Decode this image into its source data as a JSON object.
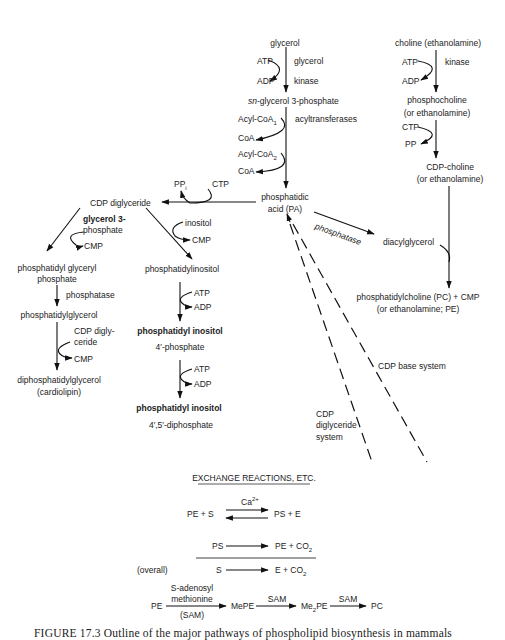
{
  "figure": {
    "caption": "FIGURE 17.3  Outline of the major pathways of phospholipid biosynthesis in mammals"
  },
  "glycerol_branch": {
    "start": "glycerol",
    "step1_in": "ATP",
    "step1_out": "ADP",
    "step1_enzyme_line1": "glycerol",
    "step1_enzyme_line2": "kinase",
    "intermediate_prefix": "sn",
    "intermediate": "-glycerol 3-phosphate",
    "acyl1_in": "Acyl-CoA",
    "acyl1_sub": "1",
    "acyl1_out": "CoA",
    "acyl2_in": "Acyl-CoA",
    "acyl2_sub": "2",
    "acyl2_out": "CoA",
    "acyl_enzyme": "acyltransferases",
    "product_line1": "phosphatidic",
    "product_line2": "acid (PA)"
  },
  "choline_branch": {
    "start": "choline (ethanolamine)",
    "step1_in": "ATP",
    "step1_out": "ADP",
    "step1_enzyme": "kinase",
    "intermediate_line1": "phosphocholine",
    "intermediate_line2": "(or ethanolamine)",
    "step2_in": "CTP",
    "step2_out": "PP",
    "cdp_line1": "CDP-choline",
    "cdp_line2": "(or ethanolamine)",
    "product_line1": "phosphatidylcholine (PC) + CMP",
    "product_line2": "(or ethanolamine; PE)"
  },
  "pa_branch": {
    "phosphatase_label": "phosphatase",
    "diacylglycerol": "diacylglycerol",
    "ctp": "CTP",
    "ppi": "PP",
    "ppi_sub": "i",
    "cdp_diglyceride": "CDP diglyceride"
  },
  "cardiolipin_branch": {
    "in1_line1": "glycerol 3-",
    "in1_line2": "phosphate",
    "out1": "CMP",
    "pgp_line1": "phosphatidyl glyceryl",
    "pgp_line2": "phosphate",
    "enzyme2": "phosphatase",
    "pg": "phosphatidylglycerol",
    "in3_line1": "CDP digly-",
    "in3_line2": "ceride",
    "out3": "CMP",
    "product_line1": "diphosphatidylglycerol",
    "product_line2": "(cardiolipin)"
  },
  "inositol_branch": {
    "in1": "inositol",
    "out1": "CMP",
    "pi": "phosphatidylinositol",
    "in2": "ATP",
    "out2": "ADP",
    "pip_line1": "phosphatidyl inositol",
    "pip_line2": "4′-phosphate",
    "in3": "ATP",
    "out3": "ADP",
    "pip2_line1": "phosphatidyl inositol",
    "pip2_line2": "4′,5′-diphosphate"
  },
  "systems": {
    "cdp_base": "CDP base system",
    "cdp_diglyceride_line1": "CDP",
    "cdp_diglyceride_line2": "diglyceride",
    "cdp_diglyceride_line3": "system"
  },
  "exchange": {
    "title": "EXCHANGE REACTIONS, ETC.",
    "cofactor": "Ca",
    "cofactor_sup": "2+",
    "eq1_left": "PE + S",
    "eq1_right": "PS + E",
    "eq2_left": "PS",
    "eq2_right": "PE + CO",
    "eq2_sub": "2",
    "overall_label": "(overall)",
    "eq3_left": "S",
    "eq3_right": "E + CO",
    "eq3_sub": "2",
    "meth_start": "PE",
    "meth_enzyme_line1": "S-adenosyl",
    "meth_enzyme_line2": "methionine",
    "meth_enzyme_line3": "(SAM)",
    "meth_mid1": "MePE",
    "meth_sam2": "SAM",
    "meth_mid2_prefix": "Me",
    "meth_mid2_sub": "2",
    "meth_mid2_suffix": "PE",
    "meth_sam3": "SAM",
    "meth_end": "PC"
  }
}
